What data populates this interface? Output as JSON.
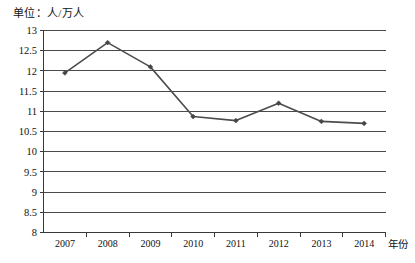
{
  "unit_label": "单位：人/万人",
  "chart_data": {
    "type": "line",
    "title": "",
    "subtitle": "",
    "unit_note": "单位：人/万人",
    "xlabel": "年份",
    "ylabel": "",
    "categories": [
      "2007",
      "2008",
      "2009",
      "2010",
      "2011",
      "2012",
      "2013",
      "2014"
    ],
    "values": [
      11.95,
      12.7,
      12.1,
      10.87,
      10.77,
      11.2,
      10.75,
      10.7
    ],
    "series": [
      {
        "name": "人/万人",
        "values": [
          11.95,
          12.7,
          12.1,
          10.87,
          10.77,
          11.2,
          10.75,
          10.7
        ]
      }
    ],
    "ylim": [
      8,
      13
    ],
    "ytick_labels": [
      "13",
      "12.5",
      "12",
      "11.5",
      "11",
      "10.5",
      "10",
      "9.5",
      "9",
      "8.5",
      "8"
    ],
    "ytick_values": [
      13,
      12.5,
      12,
      11.5,
      11,
      10.5,
      10,
      9.5,
      9,
      8.5,
      8
    ],
    "grid": true,
    "legend": false,
    "legend_position": "none",
    "line_color": "#4d4d4d",
    "marker_color": "#454545",
    "grid_color": "#4a4a4a",
    "axis_color": "#3a3a3a",
    "background_color": "#ffffff"
  }
}
